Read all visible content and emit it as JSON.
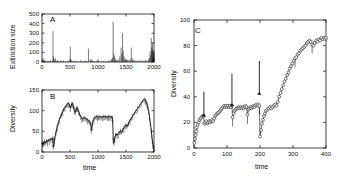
{
  "figure": {
    "background": "#ffffff",
    "ink": "#000000"
  },
  "panels": [
    {
      "id": "A",
      "tag": "A",
      "xlabel": "",
      "ylabel": "Extinction size",
      "xticks": [
        "0",
        "500",
        "1000",
        "1500",
        "2000"
      ],
      "yticks": [
        "0",
        "100",
        "200",
        "300",
        "400",
        "500"
      ]
    },
    {
      "id": "B",
      "tag": "B",
      "xlabel": "time",
      "ylabel": "Diversity",
      "xticks": [
        "0",
        "500",
        "1000",
        "1500",
        "2000"
      ],
      "yticks": [
        "0",
        "50",
        "100",
        "150"
      ]
    },
    {
      "id": "C",
      "tag": "C",
      "xlabel": "time",
      "ylabel": "Diversity",
      "xticks": [
        "0",
        "100",
        "200",
        "300",
        "400"
      ],
      "yticks": [
        "0",
        "20",
        "40",
        "60",
        "80",
        "100"
      ]
    }
  ],
  "chart_data": [
    {
      "type": "bar",
      "panel": "A",
      "title": "A",
      "xlabel": "",
      "ylabel": "Extinction size",
      "xlim": [
        0,
        2000
      ],
      "ylim": [
        0,
        500
      ],
      "xticks": [
        0,
        500,
        1000,
        1500,
        2000
      ],
      "yticks": [
        0,
        100,
        200,
        300,
        400,
        500
      ],
      "grid": false,
      "legend": "none",
      "x": [
        12,
        20,
        34,
        48,
        62,
        90,
        118,
        150,
        182,
        196,
        205,
        214,
        228,
        240,
        262,
        280,
        300,
        330,
        352,
        380,
        420,
        455,
        480,
        505,
        510,
        530,
        560,
        600,
        640,
        690,
        730,
        770,
        800,
        830,
        860,
        878,
        890,
        905,
        940,
        980,
        1020,
        1060,
        1100,
        1140,
        1180,
        1215,
        1240,
        1258,
        1270,
        1282,
        1295,
        1310,
        1330,
        1350,
        1370,
        1390,
        1412,
        1425,
        1438,
        1450,
        1462,
        1478,
        1495,
        1512,
        1530,
        1552,
        1575,
        1595,
        1612,
        1630,
        1655,
        1680,
        1700,
        1730,
        1760,
        1790,
        1820,
        1850,
        1875,
        1900,
        1918,
        1930,
        1942,
        1952,
        1960,
        1966,
        1972,
        1978,
        1982,
        1986,
        1990,
        1994,
        1997,
        1999
      ],
      "values": [
        18,
        40,
        12,
        25,
        10,
        15,
        8,
        22,
        12,
        320,
        60,
        30,
        18,
        40,
        12,
        22,
        9,
        14,
        11,
        20,
        9,
        13,
        10,
        160,
        35,
        18,
        12,
        14,
        9,
        18,
        11,
        16,
        9,
        140,
        30,
        22,
        14,
        18,
        10,
        12,
        9,
        14,
        11,
        13,
        16,
        20,
        30,
        45,
        420,
        90,
        60,
        35,
        22,
        18,
        25,
        60,
        150,
        90,
        300,
        120,
        60,
        35,
        28,
        22,
        18,
        20,
        30,
        150,
        40,
        22,
        18,
        14,
        12,
        18,
        14,
        16,
        12,
        20,
        14,
        28,
        45,
        110,
        70,
        250,
        150,
        95,
        200,
        60,
        130,
        35,
        90,
        45,
        70,
        110
      ]
    },
    {
      "type": "line",
      "panel": "B",
      "title": "B",
      "xlabel": "time",
      "ylabel": "Diversity",
      "xlim": [
        0,
        2000
      ],
      "ylim": [
        0,
        150
      ],
      "xticks": [
        0,
        500,
        1000,
        1500,
        2000
      ],
      "yticks": [
        0,
        50,
        100,
        150
      ],
      "grid": false,
      "legend": "none",
      "x": [
        0,
        10,
        20,
        30,
        45,
        60,
        80,
        100,
        120,
        140,
        160,
        180,
        196,
        200,
        215,
        230,
        250,
        270,
        290,
        310,
        330,
        350,
        370,
        390,
        410,
        430,
        450,
        470,
        490,
        505,
        520,
        535,
        550,
        565,
        580,
        595,
        610,
        625,
        640,
        655,
        670,
        690,
        710,
        730,
        750,
        770,
        790,
        810,
        830,
        850,
        870,
        880,
        895,
        910,
        930,
        950,
        970,
        990,
        1010,
        1030,
        1050,
        1070,
        1090,
        1110,
        1130,
        1150,
        1170,
        1190,
        1210,
        1230,
        1250,
        1262,
        1272,
        1285,
        1300,
        1320,
        1340,
        1360,
        1380,
        1400,
        1420,
        1440,
        1460,
        1480,
        1500,
        1520,
        1545,
        1570,
        1595,
        1620,
        1650,
        1680,
        1710,
        1740,
        1770,
        1800,
        1825,
        1845,
        1860,
        1875,
        1890,
        1905,
        1920,
        1935,
        1950,
        1960,
        1970,
        1980,
        1990,
        2000
      ],
      "values": [
        22,
        18,
        24,
        20,
        26,
        22,
        28,
        25,
        30,
        27,
        33,
        30,
        34,
        12,
        20,
        35,
        48,
        60,
        70,
        78,
        86,
        92,
        98,
        104,
        108,
        112,
        116,
        118,
        115,
        106,
        112,
        118,
        116,
        110,
        100,
        96,
        104,
        108,
        104,
        98,
        92,
        86,
        82,
        80,
        84,
        82,
        80,
        78,
        76,
        74,
        70,
        52,
        62,
        74,
        82,
        84,
        86,
        85,
        84,
        86,
        85,
        84,
        86,
        85,
        86,
        85,
        84,
        86,
        85,
        84,
        86,
        78,
        30,
        22,
        34,
        44,
        40,
        44,
        48,
        52,
        48,
        54,
        58,
        62,
        66,
        62,
        70,
        76,
        82,
        88,
        94,
        100,
        106,
        112,
        118,
        124,
        128,
        126,
        122,
        116,
        108,
        98,
        86,
        70,
        54,
        40,
        28,
        18,
        12,
        10
      ]
    },
    {
      "type": "scatter",
      "panel": "C",
      "title": "C",
      "xlabel": "time",
      "ylabel": "Diversity",
      "xlim": [
        0,
        400
      ],
      "ylim": [
        0,
        100
      ],
      "xticks": [
        0,
        100,
        200,
        300,
        400
      ],
      "yticks": [
        0,
        20,
        40,
        60,
        80,
        100
      ],
      "grid": false,
      "legend": "none",
      "marker": "open-circle",
      "annotations": [
        {
          "type": "arrow",
          "direction": "down",
          "x": 30,
          "y_tip": 27,
          "y_tail": 44
        },
        {
          "type": "arrow",
          "direction": "down",
          "x": 115,
          "y_tip": 35,
          "y_tail": 58
        },
        {
          "type": "arrow",
          "direction": "down",
          "x": 198,
          "y_tip": 44,
          "y_tail": 68
        }
      ],
      "x": [
        1,
        3,
        5,
        7,
        9,
        11,
        14,
        17,
        20,
        23,
        26,
        29,
        31,
        34,
        37,
        40,
        43,
        46,
        49,
        52,
        55,
        58,
        61,
        64,
        67,
        70,
        73,
        76,
        79,
        82,
        85,
        88,
        91,
        94,
        97,
        100,
        103,
        106,
        109,
        112,
        115,
        117,
        120,
        123,
        126,
        129,
        132,
        135,
        138,
        141,
        144,
        147,
        150,
        153,
        156,
        159,
        162,
        165,
        168,
        171,
        174,
        177,
        180,
        183,
        186,
        189,
        192,
        195,
        198,
        200,
        203,
        206,
        209,
        212,
        215,
        218,
        222,
        226,
        230,
        234,
        238,
        242,
        246,
        250,
        254,
        258,
        262,
        266,
        270,
        274,
        278,
        282,
        286,
        290,
        294,
        298,
        302,
        306,
        310,
        314,
        318,
        322,
        326,
        330,
        334,
        338,
        342,
        346,
        350,
        354,
        358,
        362,
        366,
        370,
        374,
        378,
        382,
        386,
        390,
        394,
        398,
        400
      ],
      "values": [
        4,
        7,
        10,
        13,
        16,
        18,
        20,
        22,
        23,
        24,
        25,
        25,
        19,
        20,
        21,
        19,
        20,
        21,
        20,
        21,
        22,
        21,
        23,
        25,
        26,
        27,
        27,
        28,
        29,
        30,
        31,
        32,
        33,
        32,
        33,
        32,
        33,
        32,
        33,
        32,
        33,
        24,
        27,
        29,
        30,
        31,
        31,
        32,
        31,
        32,
        31,
        32,
        31,
        32,
        33,
        32,
        26,
        30,
        31,
        32,
        31,
        32,
        33,
        32,
        33,
        34,
        33,
        34,
        33,
        9,
        14,
        19,
        22,
        25,
        27,
        29,
        30,
        31,
        32,
        31,
        32,
        33,
        34,
        33,
        36,
        40,
        43,
        46,
        49,
        52,
        54,
        57,
        59,
        62,
        64,
        66,
        68,
        70,
        71,
        73,
        74,
        76,
        77,
        78,
        79,
        80,
        82,
        83,
        84,
        83,
        81,
        80,
        82,
        84,
        83,
        85,
        84,
        86,
        85,
        86,
        85,
        86,
        86
      ]
    }
  ]
}
